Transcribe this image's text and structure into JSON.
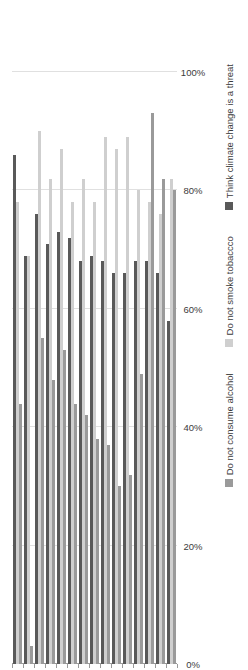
{
  "chart_data": {
    "type": "bar",
    "orientation": "horizontal",
    "title": "",
    "xlabel": "",
    "ylabel": "",
    "xlim": [
      0,
      100
    ],
    "ticks": [
      "0%",
      "20%",
      "40%",
      "60%",
      "80%",
      "100%"
    ],
    "tick_values": [
      0,
      20,
      40,
      60,
      80,
      100
    ],
    "grid": true,
    "legend_position": "bottom",
    "categories": [
      "Spain",
      "France",
      "Mexico",
      "Japan",
      "Brazil",
      "Italy",
      "Sweden",
      "Germany",
      "Canada",
      "UK",
      "Australia",
      "US",
      "Indonesia",
      "Turkey",
      "India"
    ],
    "series": [
      {
        "name": "Think climate change is a threat",
        "color": "#595959",
        "values": [
          86,
          69,
          76,
          71,
          73,
          72,
          68,
          69,
          68,
          66,
          66,
          68,
          68,
          66,
          58
        ]
      },
      {
        "name": "Do not smoke tobaccco",
        "color": "#cfcfcf",
        "values": [
          78,
          69,
          90,
          82,
          87,
          78,
          82,
          78,
          89,
          87,
          89,
          80,
          78,
          76,
          82
        ]
      },
      {
        "name": "Do not consume alcohol",
        "color": "#9a9a9a",
        "values": [
          44,
          3,
          55,
          48,
          53,
          44,
          42,
          38,
          37,
          30,
          32,
          49,
          93,
          82,
          80
        ]
      }
    ]
  },
  "legend": {
    "items": [
      {
        "label": "Think climate change is a threat",
        "color": "#595959"
      },
      {
        "label": "Do not smoke tobaccco",
        "color": "#cfcfcf"
      },
      {
        "label": "Do not consume alcohol",
        "color": "#9a9a9a"
      }
    ]
  }
}
